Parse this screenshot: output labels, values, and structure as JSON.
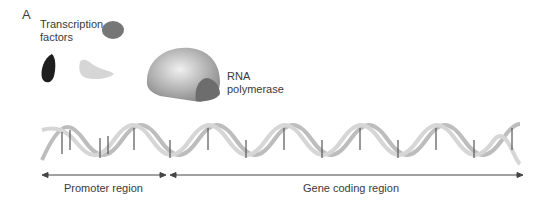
{
  "panel_label": "A",
  "labels": {
    "transcription_factors_line1": "Transcription",
    "transcription_factors_line2": "factors",
    "rna_polymerase_line1": "RNA",
    "rna_polymerase_line2": "polymerase",
    "promoter_region": "Promoter region",
    "gene_coding_region": "Gene coding region"
  },
  "colors": {
    "tf_oval": "#777777",
    "tf_dark": "#222222",
    "tf_light": "#d8d8d8",
    "polymerase": "#b5b5b5",
    "dna": "#c8c8c8",
    "arrow": "#444444"
  }
}
